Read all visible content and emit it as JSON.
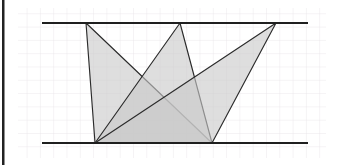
{
  "figure": {
    "title": "Three triangles with a common base between two parallel lines",
    "canvas": {
      "width": 344,
      "height": 165,
      "background": "#ffffff"
    },
    "grid": {
      "visible": true,
      "cell_size": 13.3,
      "color": "#ebe7ea",
      "area": {
        "x": 18,
        "y": 8,
        "width": 308,
        "height": 150
      }
    },
    "left_margin_bar": {
      "x": 2,
      "y": 0,
      "width": 2.5,
      "height": 165,
      "color": "#222222"
    },
    "parallel_lines": [
      {
        "name": "top-parallel-line",
        "label": "top line",
        "x1": 42,
        "y1": 23,
        "x2": 308,
        "y2": 23,
        "color": "#1f1f1f",
        "stroke_width": 2.1
      },
      {
        "name": "bottom-parallel-line",
        "label": "bottom line",
        "x1": 42,
        "y1": 143,
        "x2": 308,
        "y2": 143,
        "color": "#1f1f1f",
        "stroke_width": 2.1
      }
    ],
    "base_segment": {
      "name": "common-base",
      "x1": 95,
      "y1": 143,
      "x2": 212,
      "y2": 143
    },
    "apex_points": [
      {
        "name": "apex-left",
        "x": 86,
        "y": 23
      },
      {
        "name": "apex-middle",
        "x": 180,
        "y": 23
      },
      {
        "name": "apex-right",
        "x": 276,
        "y": 23
      }
    ],
    "base_points": [
      {
        "name": "base-left",
        "x": 95,
        "y": 143
      },
      {
        "name": "base-right",
        "x": 212,
        "y": 143
      }
    ],
    "triangles": [
      {
        "name": "triangle-left-apex",
        "points": "86,23 95,143 212,143",
        "fill": "#c9c9c9",
        "fill_opacity": 0.62,
        "stroke": "#2b2b2b",
        "stroke_width": 1.15
      },
      {
        "name": "triangle-middle-apex",
        "points": "180,23 95,143 212,143",
        "fill": "#c9c9c9",
        "fill_opacity": 0.62,
        "stroke": "#2b2b2b",
        "stroke_width": 1.15
      },
      {
        "name": "triangle-right-apex",
        "points": "276,23 95,143 212,143",
        "fill": "#c9c9c9",
        "fill_opacity": 0.62,
        "stroke": "#2b2b2b",
        "stroke_width": 1.15
      }
    ],
    "shading_levels": {
      "single_overlap": "#d0d0d0",
      "double_overlap": "#b8b8b8",
      "triple_overlap": "#9a9a9a"
    }
  },
  "chart_data": {
    "type": "diagram",
    "title": "Three triangles with a common base between two parallel lines",
    "shared_base": {
      "from": [
        95,
        143
      ],
      "to": [
        212,
        143
      ],
      "length_px": 117
    },
    "parallel_line_separation_px": 120,
    "series": [
      {
        "name": "triangle-left-apex",
        "vertices": [
          [
            86,
            23
          ],
          [
            95,
            143
          ],
          [
            212,
            143
          ]
        ]
      },
      {
        "name": "triangle-middle-apex",
        "vertices": [
          [
            180,
            23
          ],
          [
            95,
            143
          ],
          [
            212,
            143
          ]
        ]
      },
      {
        "name": "triangle-right-apex",
        "vertices": [
          [
            276,
            23
          ],
          [
            95,
            143
          ],
          [
            212,
            143
          ]
        ]
      }
    ],
    "xlabel": "",
    "ylabel": "",
    "grid": true,
    "legend": "none"
  }
}
